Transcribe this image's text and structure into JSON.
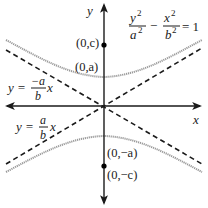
{
  "diagram": {
    "type": "hyperbola-vertical-transverse-axis",
    "axes": {
      "x_label": "x",
      "y_label": "y"
    },
    "equation": {
      "numerator_left": "y",
      "denominator_left": "a",
      "numerator_right": "x",
      "denominator_right": "b",
      "exponent": "2",
      "operator": "−",
      "equals": "= 1"
    },
    "points": {
      "focus_top": "(0,c)",
      "vertex_top": "(0,a)",
      "vertex_bottom": "(0,−a)",
      "focus_bottom": "(0,−c)"
    },
    "asymptotes": {
      "negative": {
        "lhs": "y =",
        "num": "−a",
        "den": "b",
        "var": "x"
      },
      "positive": {
        "lhs": "y =",
        "num": "a",
        "den": "b",
        "var": "x"
      }
    },
    "colors": {
      "axis": "#1a1a1a",
      "asymptote": "#1a1a1a",
      "curve": "#9a9a9a",
      "point": "#000000"
    }
  }
}
